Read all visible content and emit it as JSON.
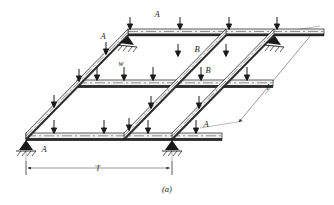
{
  "figure": {
    "caption": "(a)",
    "type": "structural-beam-grid-isometric",
    "description_labels": {
      "beam_a": "A",
      "beam_b": "B",
      "load": "w",
      "span": "l"
    },
    "labels": [
      {
        "id": "beam-label-a-top",
        "text": "A",
        "x": 157,
        "y": 17,
        "name": "beam-label-a"
      },
      {
        "id": "beam-label-a-upper-left",
        "text": "A",
        "x": 103,
        "y": 39,
        "name": "beam-label-a"
      },
      {
        "id": "beam-label-b-upper",
        "text": "B",
        "x": 197,
        "y": 52,
        "name": "beam-label-b"
      },
      {
        "id": "load-label-w",
        "text": "w",
        "x": 121,
        "y": 67,
        "name": "load-label-w"
      },
      {
        "id": "beam-label-b-middle",
        "text": "B",
        "x": 208,
        "y": 73,
        "name": "beam-label-b"
      },
      {
        "id": "beam-label-a-lower",
        "text": "A",
        "x": 206,
        "y": 125,
        "name": "beam-label-a"
      },
      {
        "id": "beam-label-a-bottom",
        "text": "A",
        "x": 44,
        "y": 151,
        "name": "beam-label-a"
      }
    ],
    "dimensions": [
      {
        "id": "dim-span-bottom",
        "label": "l",
        "x": 95,
        "y": 170,
        "name": "dimension-label-span-l"
      },
      {
        "id": "dim-span-right",
        "label": "l",
        "x": 264,
        "y": 88,
        "name": "dimension-label-span-l"
      }
    ],
    "colors": {
      "line": "#1a1a1a",
      "fill": "#f2f2f2",
      "background": "#ffffff",
      "dimension": "#555555"
    },
    "supports": [
      {
        "name": "support-bottom-left",
        "x": 26,
        "y": 137
      },
      {
        "name": "support-bottom-right",
        "x": 172,
        "y": 137
      },
      {
        "name": "support-top-left",
        "x": 128,
        "y": 39
      },
      {
        "name": "support-top-right",
        "x": 275,
        "y": 39
      }
    ]
  }
}
